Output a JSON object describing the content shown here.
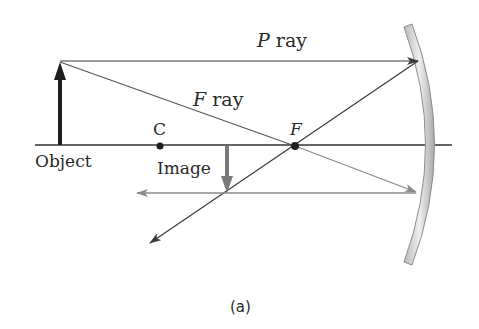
{
  "diagram": {
    "caption": "(a)",
    "labels": {
      "p_ray_letter": "P",
      "p_ray_word": " ray",
      "f_ray_letter": "F",
      "f_ray_word": " ray",
      "center_point": "C",
      "focal_point": "F",
      "object": "Object",
      "image": "Image"
    },
    "colors": {
      "ray": "#3a3a3a",
      "reflected_ray_light": "#8a8a8a",
      "object_arrow": "#1e1e1e",
      "image_arrow": "#7a7a7a",
      "mirror_fill": "#dcdcdc",
      "mirror_edge": "#8c8c8c",
      "axis": "#333333"
    },
    "geometry": {
      "axis_y": 145,
      "object_x": 60,
      "object_top_y": 62,
      "center_x": 160,
      "focal_x": 295,
      "image_x": 227,
      "image_bottom_y": 193
    }
  }
}
